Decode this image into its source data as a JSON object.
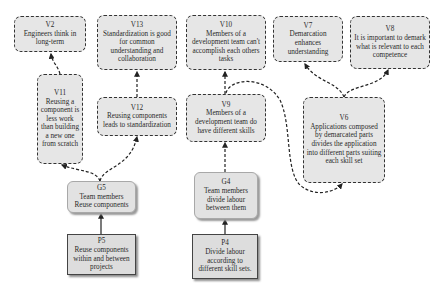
{
  "nodes": {
    "V2": {
      "id": "V2",
      "text": "Engineers think in long-term",
      "kind": "value"
    },
    "V13": {
      "id": "V13",
      "text": "Standardization is good for common understanding and collaboration",
      "kind": "value"
    },
    "V11": {
      "id": "V11",
      "text": "Reusing a component is less work than building a new one from scratch",
      "kind": "value"
    },
    "V12": {
      "id": "V12",
      "text": "Reusing components leads to standardization",
      "kind": "value"
    },
    "G5": {
      "id": "G5",
      "text": "Team members Reuse components",
      "kind": "goal"
    },
    "P5": {
      "id": "P5",
      "text": "Reuse components within and between projects",
      "kind": "practice"
    },
    "V10": {
      "id": "V10",
      "text": "Members of a development team can't accomplish each others tasks",
      "kind": "value"
    },
    "V9": {
      "id": "V9",
      "text": "Members of a development team do have different skills",
      "kind": "value"
    },
    "G4": {
      "id": "G4",
      "text": "Team members divide labour between them",
      "kind": "goal"
    },
    "P4": {
      "id": "P4",
      "text": "Divide labour according to different skill sets.",
      "kind": "practice"
    },
    "V7": {
      "id": "V7",
      "text": "Demarcation enhances understanding",
      "kind": "value"
    },
    "V8": {
      "id": "V8",
      "text": "It is important to demark what is relevant to each competence",
      "kind": "value"
    },
    "V6": {
      "id": "V6",
      "text": "Applications composed by demarcated parts divides the application into different parts suiting each skill set",
      "kind": "value"
    }
  },
  "edges": [
    {
      "from": "P5",
      "to": "G5",
      "style": "solid"
    },
    {
      "from": "G5",
      "to": "V11",
      "style": "dashed"
    },
    {
      "from": "G5",
      "to": "V12",
      "style": "dashed"
    },
    {
      "from": "V11",
      "to": "V2",
      "style": "dashed"
    },
    {
      "from": "V12",
      "to": "V13",
      "style": "dashed"
    },
    {
      "from": "P4",
      "to": "G4",
      "style": "solid"
    },
    {
      "from": "G4",
      "to": "V9",
      "style": "dashed"
    },
    {
      "from": "V9",
      "to": "V10",
      "style": "dashed"
    },
    {
      "from": "V9",
      "to": "V6",
      "style": "dashed"
    },
    {
      "from": "V6",
      "to": "V7",
      "style": "dashed"
    },
    {
      "from": "V6",
      "to": "V8",
      "style": "dashed"
    }
  ],
  "colors": {
    "stroke": "#2a2a2a",
    "value_fill": "#e6e6e6",
    "goal_fill": "#e2e2e2",
    "practice_fill": "#dddddd"
  }
}
